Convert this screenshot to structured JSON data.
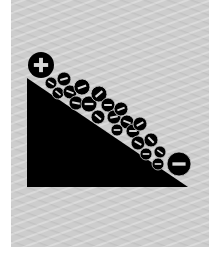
{
  "illustration": {
    "title": "",
    "colors": {
      "page_background": "#ffffff",
      "panel_background": "#cdcdcd",
      "foreground": "#000000",
      "symbol": "#d9d9d9"
    },
    "slope": {
      "points": [
        [
          27,
          78
        ],
        [
          27,
          187
        ],
        [
          188,
          187
        ]
      ]
    },
    "positive_charge": {
      "cx": 41,
      "cy": 65,
      "r": 13,
      "symbol": "plus"
    },
    "large_negative_charge": {
      "cx": 179,
      "cy": 164,
      "r": 12,
      "symbol": "minus"
    },
    "negative_charges": [
      {
        "cx": 51,
        "cy": 83,
        "r": 6,
        "angle": 30
      },
      {
        "cx": 64,
        "cy": 79,
        "r": 7,
        "angle": -15
      },
      {
        "cx": 58,
        "cy": 93,
        "r": 6,
        "angle": 40
      },
      {
        "cx": 70,
        "cy": 92,
        "r": 7,
        "angle": 20
      },
      {
        "cx": 82,
        "cy": 87,
        "r": 8,
        "angle": -20
      },
      {
        "cx": 76,
        "cy": 103,
        "r": 7,
        "angle": 10
      },
      {
        "cx": 89,
        "cy": 104,
        "r": 8,
        "angle": 0
      },
      {
        "cx": 99,
        "cy": 94,
        "r": 8,
        "angle": -40
      },
      {
        "cx": 108,
        "cy": 105,
        "r": 7,
        "angle": 0
      },
      {
        "cx": 98,
        "cy": 117,
        "r": 7,
        "angle": 40
      },
      {
        "cx": 114,
        "cy": 117,
        "r": 7,
        "angle": -10
      },
      {
        "cx": 121,
        "cy": 109,
        "r": 7,
        "angle": -20
      },
      {
        "cx": 127,
        "cy": 122,
        "r": 7,
        "angle": 20
      },
      {
        "cx": 117,
        "cy": 130,
        "r": 6,
        "angle": 0
      },
      {
        "cx": 133,
        "cy": 131,
        "r": 7,
        "angle": 0
      },
      {
        "cx": 140,
        "cy": 124,
        "r": 7,
        "angle": -30
      },
      {
        "cx": 138,
        "cy": 143,
        "r": 7,
        "angle": 30
      },
      {
        "cx": 151,
        "cy": 140,
        "r": 7,
        "angle": 45
      },
      {
        "cx": 146,
        "cy": 154,
        "r": 6,
        "angle": 0
      },
      {
        "cx": 160,
        "cy": 152,
        "r": 6,
        "angle": 35
      },
      {
        "cx": 158,
        "cy": 164,
        "r": 6,
        "angle": 0
      }
    ]
  }
}
